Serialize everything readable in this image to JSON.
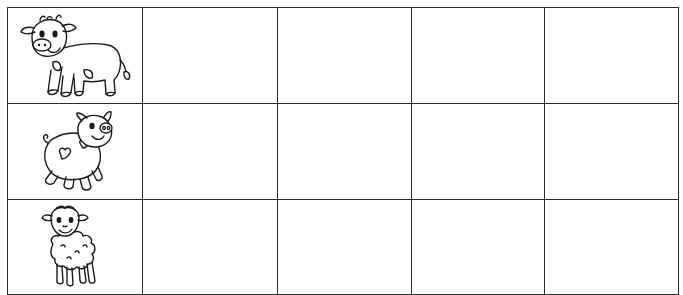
{
  "worksheet": {
    "grid": {
      "rows": 3,
      "columns": 5,
      "line_color": "#2a2a2a",
      "background": "#ffffff"
    },
    "rows": [
      {
        "animal": "cow",
        "icon": "cow-drawing",
        "cells": [
          "",
          "",
          "",
          ""
        ]
      },
      {
        "animal": "pig",
        "icon": "pig-drawing",
        "cells": [
          "",
          "",
          "",
          ""
        ]
      },
      {
        "animal": "sheep",
        "icon": "sheep-drawing",
        "cells": [
          "",
          "",
          "",
          ""
        ]
      }
    ]
  }
}
